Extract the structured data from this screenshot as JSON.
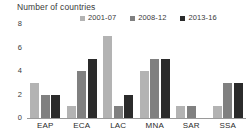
{
  "chart_data": {
    "type": "bar",
    "title": "Number of countries",
    "xlabel": "",
    "ylabel": "Number of countries",
    "ylim": [
      0,
      8
    ],
    "yticks": [
      0,
      2,
      4,
      6,
      8
    ],
    "grid": false,
    "legend_position": "top-right",
    "categories": [
      "EAP",
      "ECA",
      "LAC",
      "MNA",
      "SAR",
      "SSA"
    ],
    "series": [
      {
        "name": "2001-07",
        "color": "#b3b3b3",
        "values": [
          3,
          1,
          7,
          4,
          1,
          1
        ]
      },
      {
        "name": "2008-12",
        "color": "#808080",
        "values": [
          2,
          4,
          1,
          5,
          1,
          3
        ]
      },
      {
        "name": "2013-16",
        "color": "#2b2b2b",
        "values": [
          2,
          5,
          2,
          5,
          0,
          3
        ]
      }
    ]
  },
  "colors": {
    "series_1": "#b3b3b3",
    "series_2": "#808080",
    "series_3": "#2b2b2b",
    "axis": "#9a9a9a",
    "text": "#2b2b2b",
    "background": "#ffffff"
  }
}
